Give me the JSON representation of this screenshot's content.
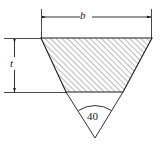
{
  "figure": {
    "type": "engineering-cross-section",
    "background_color": "#ffffff",
    "line_color": "#1a1a1a",
    "hatch_color": "#4a4a4a",
    "dimensions": {
      "top_width": {
        "label": "b",
        "style": "italic",
        "orientation": "horizontal",
        "arrow_ends": "both"
      },
      "depth": {
        "label": "t",
        "style": "italic",
        "orientation": "vertical",
        "arrow_ends": "both"
      },
      "included_angle": {
        "label": "40",
        "units": "degrees",
        "style": "upright",
        "arc": true
      }
    },
    "geometry": {
      "top_left": [
        41,
        38
      ],
      "top_right": [
        152,
        38
      ],
      "bottom_left": [
        66,
        92
      ],
      "bottom_right": [
        123,
        92
      ],
      "apex": [
        95,
        138
      ],
      "hatch_angle_deg": 45,
      "hatch_spacing_px": 4
    }
  }
}
